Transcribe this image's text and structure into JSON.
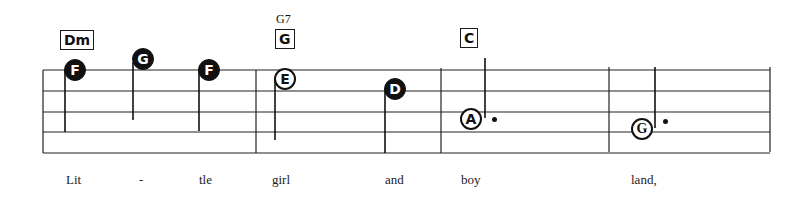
{
  "chords": [
    {
      "label": "Dm",
      "alt": null
    },
    {
      "label": "G",
      "alt": "G7"
    },
    {
      "label": "C",
      "alt": null
    }
  ],
  "notes": [
    {
      "name": "F",
      "style": "filled",
      "duration": "quarter"
    },
    {
      "name": "G",
      "style": "filled",
      "duration": "quarter"
    },
    {
      "name": "F",
      "style": "filled",
      "duration": "quarter"
    },
    {
      "name": "E",
      "style": "open",
      "duration": "half"
    },
    {
      "name": "D",
      "style": "filled",
      "duration": "quarter"
    },
    {
      "name": "A",
      "style": "open",
      "duration": "dotted-half"
    },
    {
      "name": "G",
      "style": "open",
      "duration": "dotted-half"
    }
  ],
  "lyrics": [
    "Lit",
    "-",
    "tle",
    "girl",
    "and",
    "boy",
    "land,"
  ],
  "staff": {
    "lines": 5,
    "measures": 4
  }
}
